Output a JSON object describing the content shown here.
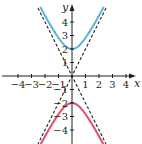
{
  "chart_data": {
    "type": "line",
    "title": "",
    "xlabel": "x",
    "ylabel": "y",
    "xlim": [
      -5,
      5
    ],
    "ylim": [
      -5,
      5.3
    ],
    "grid": false,
    "x_ticks": [
      -4,
      -3,
      -2,
      -1,
      1,
      2,
      3,
      4
    ],
    "x_tick_labels": [
      "−4",
      "−3",
      "−2",
      "−1",
      "1",
      "2",
      "3",
      "4"
    ],
    "y_ticks": [
      4,
      3,
      2,
      1,
      -1,
      -2,
      -3,
      -4
    ],
    "y_tick_labels": [
      "4",
      "3",
      "2",
      "1",
      "−1",
      "−2",
      "−3",
      "−4"
    ],
    "equation": "y^2/4 - x^2 = 1",
    "series": [
      {
        "name": "upper-branch",
        "color": "#5ab4d6",
        "style": "solid",
        "function": "y = 2*sqrt(1 + x^2)",
        "x_range": [
          -2.35,
          2.35
        ],
        "vertex": [
          0,
          2
        ]
      },
      {
        "name": "lower-branch",
        "color": "#d9536e",
        "style": "solid",
        "function": "y = -2*sqrt(1 + x^2)",
        "x_range": [
          -2.35,
          2.35
        ],
        "vertex": [
          0,
          -2
        ]
      },
      {
        "name": "asymptote-positive",
        "color": "#231f20",
        "style": "dashed",
        "function": "y = 2x"
      },
      {
        "name": "asymptote-negative",
        "color": "#231f20",
        "style": "dashed",
        "function": "y = -2x"
      }
    ],
    "layout": {
      "origin_px": [
        72,
        76
      ],
      "unit_px": 13.5,
      "plot_top_px": 8,
      "plot_bottom_px": 144
    }
  }
}
